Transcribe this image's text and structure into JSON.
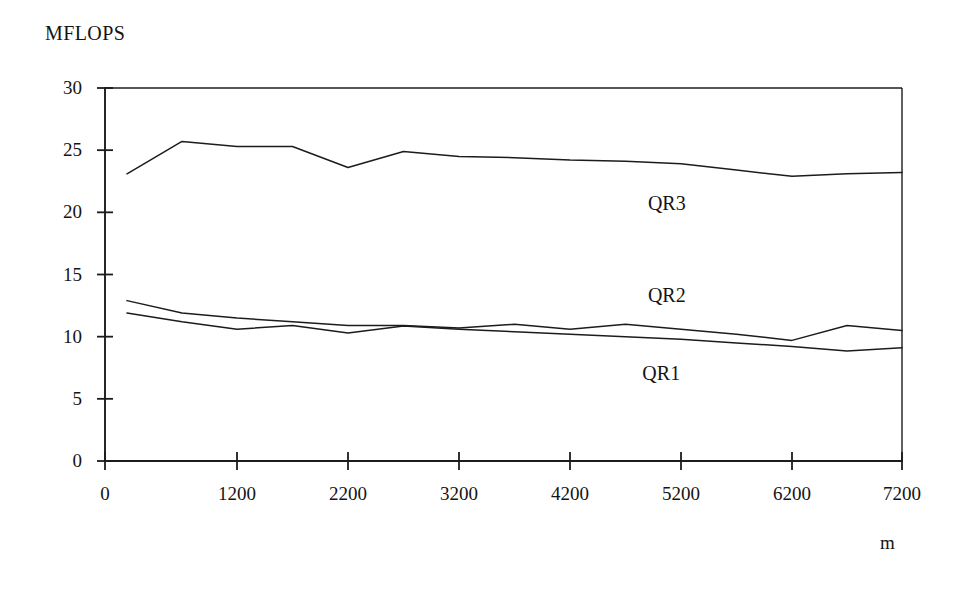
{
  "chart_data": {
    "type": "line",
    "title": "",
    "ylabel": "MFLOPS",
    "xlabel": "m",
    "ylim": [
      0,
      30
    ],
    "xlim": [
      0,
      7200
    ],
    "yticks": [
      0,
      5,
      10,
      15,
      20,
      25,
      30
    ],
    "ytick_labels": [
      "0",
      "5",
      "10",
      "15",
      "20",
      "25",
      "30"
    ],
    "xticks": [
      0,
      1200,
      2200,
      3200,
      4200,
      5200,
      6200,
      7200
    ],
    "xtick_labels": [
      "0",
      "1200",
      "2200",
      "3200",
      "4200",
      "5200",
      "6200",
      "7200"
    ],
    "grid": false,
    "legend_position": "inline-annotations",
    "x": [
      200,
      700,
      1200,
      1700,
      2200,
      2700,
      3200,
      3700,
      4200,
      4700,
      5200,
      5700,
      6200,
      6700,
      7200
    ],
    "series": [
      {
        "name": "QR3",
        "label": "QR3",
        "label_x": 5100,
        "label_y": 20.6,
        "values": [
          23.1,
          25.7,
          25.3,
          25.3,
          23.6,
          24.9,
          24.5,
          24.4,
          24.2,
          24.1,
          23.9,
          23.4,
          22.9,
          23.1,
          23.2
        ]
      },
      {
        "name": "QR2",
        "label": "QR2",
        "label_x": 5100,
        "label_y": 13.2,
        "values": [
          12.9,
          11.9,
          11.5,
          11.2,
          10.9,
          10.9,
          10.7,
          11.0,
          10.6,
          11.0,
          10.6,
          10.2,
          9.7,
          10.9,
          10.5
        ]
      },
      {
        "name": "QR1",
        "label": "QR1",
        "label_x": 5050,
        "label_y": 6.9,
        "values": [
          11.9,
          11.2,
          10.6,
          10.9,
          10.3,
          10.85,
          10.6,
          10.4,
          10.2,
          10.0,
          9.8,
          9.5,
          9.2,
          8.85,
          9.1
        ]
      }
    ],
    "colors": {
      "line": "#1c1c1c",
      "axis": "#1c1c1c",
      "text": "#141414",
      "background": "#ffffff"
    }
  }
}
